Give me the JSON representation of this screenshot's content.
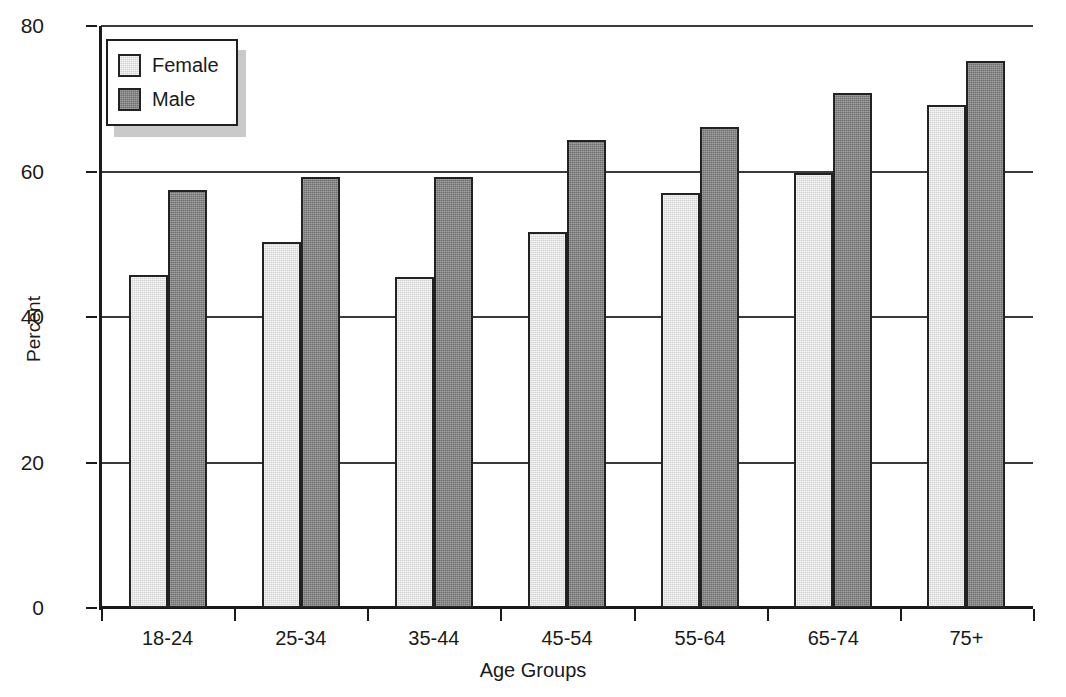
{
  "chart_data": {
    "type": "bar",
    "title": "",
    "xlabel": "Age Groups",
    "ylabel": "Percent",
    "categories": [
      "18-24",
      "25-34",
      "35-44",
      "45-54",
      "55-64",
      "65-74",
      "75+"
    ],
    "series": [
      {
        "name": "Female",
        "color": "#d2d2d2",
        "values": [
          45.8,
          50.3,
          45.5,
          51.7,
          57.0,
          59.8,
          69.2
        ]
      },
      {
        "name": "Male",
        "color": "#6e6e6e",
        "values": [
          57.4,
          59.2,
          59.2,
          64.4,
          66.1,
          70.8,
          75.2
        ]
      }
    ],
    "ylim": [
      0,
      80
    ],
    "yticks": [
      0,
      20,
      40,
      60,
      80
    ],
    "ytick_labels": [
      "0",
      "20",
      "40",
      "60",
      "80"
    ],
    "grid": "horizontal",
    "legend_position": "top-left",
    "legend_entries": [
      "Female",
      "Male"
    ]
  },
  "legend": {
    "items": [
      {
        "label": "Female",
        "swatch": "legend-swatch-female"
      },
      {
        "label": "Male",
        "swatch": "legend-swatch-male"
      }
    ]
  },
  "axes": {
    "y_title": "Percent",
    "x_title": "Age Groups"
  }
}
